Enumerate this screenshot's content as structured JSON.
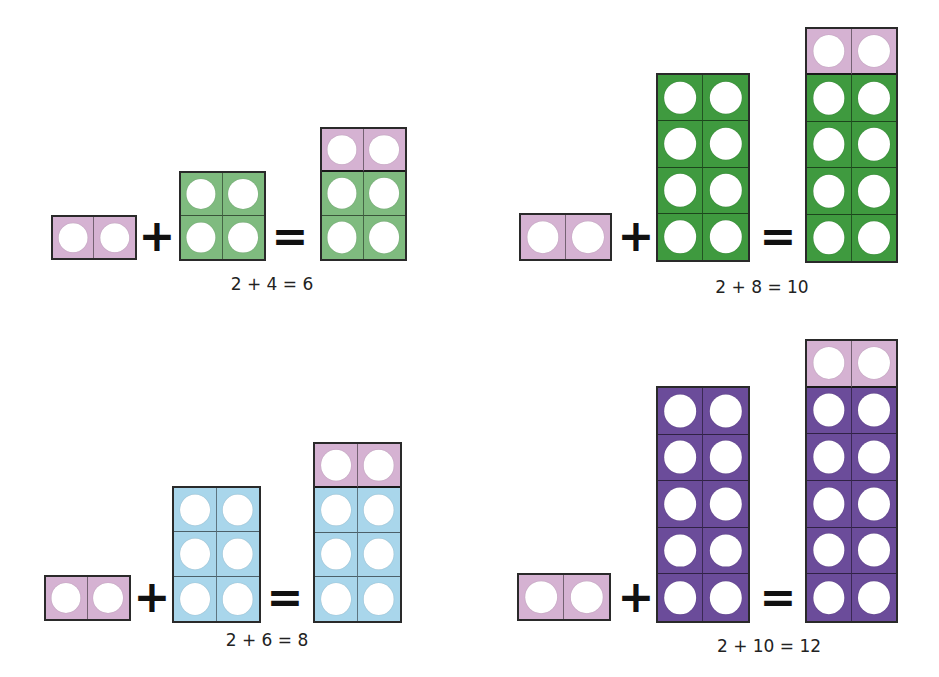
{
  "colors": {
    "two": "#d5b2d2",
    "four": "#7fbb7f",
    "eight": "#3f9a3f",
    "six": "#a9d6eb",
    "ten": "#6b4c9a",
    "outline": "#2a2a2a",
    "hole": "#ffffff"
  },
  "operators": {
    "plus": "+",
    "equals": "="
  },
  "equations": [
    {
      "id": "eq-2-plus-4",
      "addend_a": 2,
      "addend_b": 4,
      "sum": 6,
      "addend_b_color": "four",
      "label": "2 + 4 = 6"
    },
    {
      "id": "eq-2-plus-8",
      "addend_a": 2,
      "addend_b": 8,
      "sum": 10,
      "addend_b_color": "eight",
      "label": "2 + 8 = 10"
    },
    {
      "id": "eq-2-plus-6",
      "addend_a": 2,
      "addend_b": 6,
      "sum": 8,
      "addend_b_color": "six",
      "label": "2 + 6 = 8"
    },
    {
      "id": "eq-2-plus-10",
      "addend_a": 2,
      "addend_b": 10,
      "sum": 12,
      "addend_b_color": "ten",
      "label": "2 + 10 = 12"
    }
  ]
}
